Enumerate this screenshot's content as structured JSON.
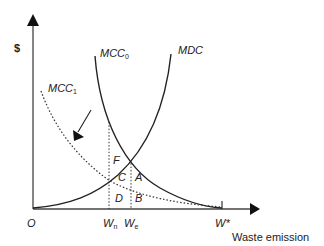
{
  "diagram": {
    "y_axis_label": "$",
    "x_axis_label": "Waste emission",
    "origin_label": "O",
    "curves": {
      "mcc0": {
        "label": "MCC",
        "sub": "0",
        "style": "solid"
      },
      "mcc1": {
        "label": "MCC",
        "sub": "1",
        "style": "dotted"
      },
      "mdc": {
        "label": "MDC",
        "style": "solid"
      }
    },
    "x_ticks": {
      "wn": {
        "label": "W",
        "sub": "n"
      },
      "we": {
        "label": "W",
        "sub": "e"
      },
      "wstar": {
        "label": "W*"
      }
    },
    "areas": {
      "F": "F",
      "C": "C",
      "A": "A",
      "D": "D",
      "B": "B"
    },
    "shift_arrow": "arrow indicating MCC shift from MCC0 to MCC1",
    "colors": {
      "line": "#222222",
      "background": "#ffffff"
    }
  }
}
